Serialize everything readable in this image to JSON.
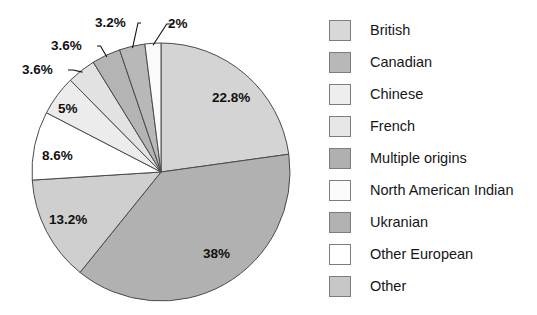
{
  "chart_data": {
    "type": "pie",
    "title": "",
    "xlabel": "",
    "ylabel": "",
    "legend_position": "right",
    "grid": false,
    "start_angle_deg": 0,
    "direction": "clockwise",
    "categories": [
      "British",
      "Canadian",
      "Other",
      "Other European",
      "Chinese",
      "French",
      "Ukranian",
      "Multiple origins",
      "North American Indian"
    ],
    "values": [
      22.8,
      38,
      13.2,
      8.6,
      5,
      3.6,
      3.6,
      3.2,
      2
    ],
    "value_labels": [
      "22.8%",
      "38%",
      "13.2%",
      "8.6%",
      "5%",
      "3.6%",
      "3.6%",
      "3.2%",
      "2%"
    ],
    "colors": [
      "#d4d4d4",
      "#b1b1b1",
      "#cfcfcf",
      "#ffffff",
      "#ececec",
      "#e2e2e2",
      "#b4b4b4",
      "#b8b8b8",
      "#fafafa"
    ],
    "slices": [
      {
        "label": "British",
        "value": 22.8,
        "value_label": "22.8%",
        "color": "#d4d4d4",
        "label_inside": true,
        "label_x": 212,
        "label_y": 102
      },
      {
        "label": "Canadian",
        "value": 38,
        "value_label": "38%",
        "color": "#b1b1b1",
        "label_inside": true,
        "label_x": 203,
        "label_y": 258
      },
      {
        "label": "Other",
        "value": 13.2,
        "value_label": "13.2%",
        "color": "#cfcfcf",
        "label_inside": true,
        "label_x": 49,
        "label_y": 224
      },
      {
        "label": "Other European",
        "value": 8.6,
        "value_label": "8.6%",
        "color": "#ffffff",
        "label_inside": true,
        "label_x": 42,
        "label_y": 160
      },
      {
        "label": "Chinese",
        "value": 5,
        "value_label": "5%",
        "color": "#ececec",
        "label_inside": true,
        "label_x": 58,
        "label_y": 113
      },
      {
        "label": "French",
        "value": 3.6,
        "value_label": "3.6%",
        "color": "#e2e2e2",
        "label_inside": false,
        "label_x": 22,
        "label_y": 74
      },
      {
        "label": "Ukranian",
        "value": 3.6,
        "value_label": "3.6%",
        "color": "#b4b4b4",
        "label_inside": false,
        "label_x": 51,
        "label_y": 50
      },
      {
        "label": "Multiple origins",
        "value": 3.2,
        "value_label": "3.2%",
        "color": "#b8b8b8",
        "label_inside": false,
        "label_x": 95,
        "label_y": 27
      },
      {
        "label": "North American Indian",
        "value": 2,
        "value_label": "2%",
        "color": "#fafafa",
        "label_inside": false,
        "label_x": 168,
        "label_y": 28
      }
    ],
    "geometry": {
      "cx": 161,
      "cy": 172,
      "r": 129
    }
  },
  "legend": {
    "items": [
      {
        "label": "British",
        "color": "#d8d8d8"
      },
      {
        "label": "Canadian",
        "color": "#b8b8b8"
      },
      {
        "label": "Chinese",
        "color": "#eeeeee"
      },
      {
        "label": "French",
        "color": "#e6e6e6"
      },
      {
        "label": "Multiple origins",
        "color": "#b0b0b0"
      },
      {
        "label": "North American Indian",
        "color": "#fbfbfb"
      },
      {
        "label": "Ukranian",
        "color": "#b2b2b2"
      },
      {
        "label": "Other European",
        "color": "#ffffff"
      },
      {
        "label": "Other",
        "color": "#c7c7c7"
      }
    ]
  }
}
